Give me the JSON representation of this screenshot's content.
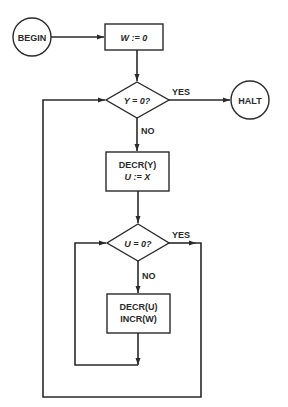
{
  "diagram": {
    "type": "flowchart",
    "nodes": {
      "begin": {
        "label": "BEGIN",
        "shape": "circle"
      },
      "init": {
        "label": "W := 0",
        "shape": "rect"
      },
      "test_y": {
        "label": "Y = 0?",
        "shape": "diamond"
      },
      "halt": {
        "label": "HALT",
        "shape": "circle"
      },
      "step_y": {
        "line1": "DECR(Y)",
        "line2": "U := X",
        "shape": "rect"
      },
      "test_u": {
        "label": "U = 0?",
        "shape": "diamond"
      },
      "step_u": {
        "line1": "DECR(U)",
        "line2": "INCR(W)",
        "shape": "rect"
      }
    },
    "edge_labels": {
      "test_y_yes": "YES",
      "test_y_no": "NO",
      "test_u_yes": "YES",
      "test_u_no": "NO"
    },
    "colors": {
      "stroke": "#2a2a2a",
      "background": "#ffffff"
    }
  }
}
